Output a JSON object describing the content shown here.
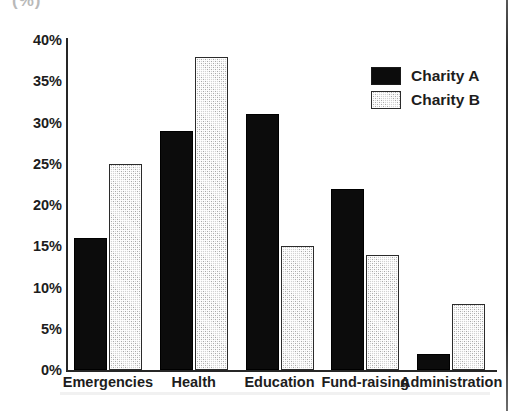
{
  "chart_data": {
    "type": "bar",
    "title": "",
    "subtitle": "",
    "xlabel": "",
    "ylabel": "",
    "ylim": [
      0,
      40
    ],
    "y_tick_labels": [
      "40%",
      "35%",
      "30%",
      "25%",
      "20%",
      "15%",
      "10%",
      "5%",
      "0%"
    ],
    "y_tick_values": [
      40,
      35,
      30,
      25,
      20,
      15,
      10,
      5,
      0
    ],
    "grid": false,
    "legend_position": "top-right-inside",
    "categories": [
      "Emergencies",
      "Health",
      "Education",
      "Fund-raising",
      "Administration"
    ],
    "series": [
      {
        "name": "Charity A",
        "color": "#0c0c0c",
        "fill": "solid-black",
        "values": [
          16,
          29,
          31,
          22,
          2
        ]
      },
      {
        "name": "Charity B",
        "color": "#d2d2d2",
        "fill": "stippled-gray",
        "values": [
          25,
          38,
          15,
          14,
          8
        ]
      }
    ],
    "value_unit": "%"
  },
  "legend": {
    "entries": [
      {
        "label": "Charity A"
      },
      {
        "label": "Charity B"
      }
    ]
  },
  "artifacts": {
    "top_fragment_text": "(%)"
  }
}
